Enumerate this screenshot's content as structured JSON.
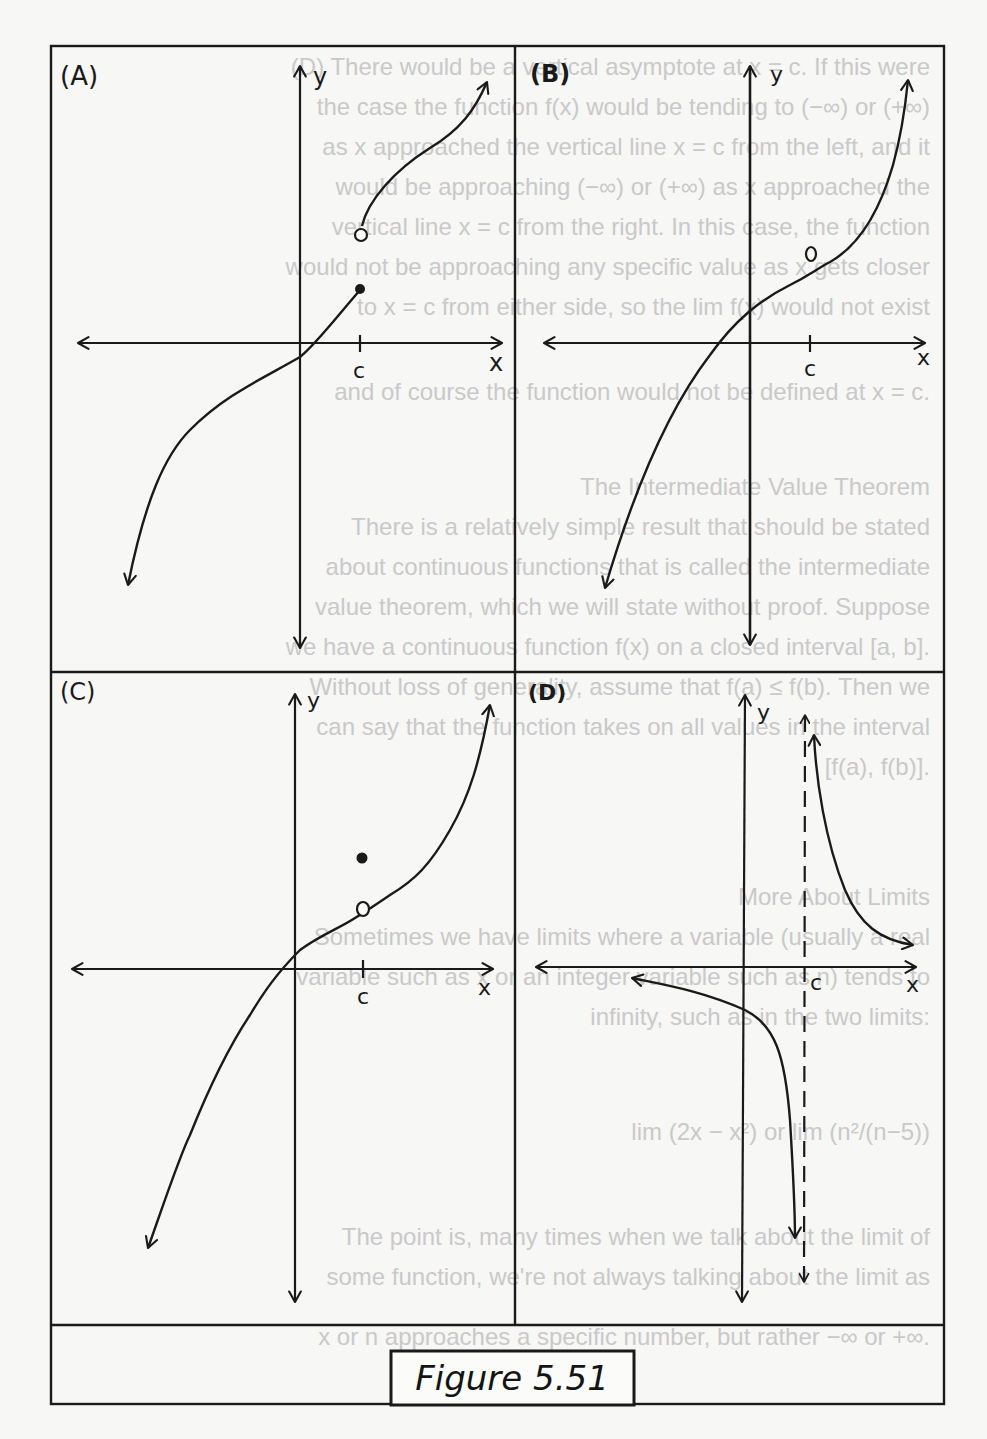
{
  "figure": {
    "caption": "Figure 5.51",
    "colors": {
      "ink": "#1a1a1a",
      "paper": "#f7f7f5",
      "bleed_through": "#c9c9c9"
    }
  },
  "panels": [
    {
      "label": "(A)",
      "x_axis_label": "x",
      "y_axis_label": "y",
      "tick_label": "c",
      "description": "Jump discontinuity at x = c: left branch ends at closed dot, right branch begins at open circle higher up."
    },
    {
      "label": "(B)",
      "x_axis_label": "x",
      "y_axis_label": "y",
      "tick_label": "c",
      "description": "Continuous increasing curve with an open circle (hole) at x = c."
    },
    {
      "label": "(C)",
      "x_axis_label": "x",
      "y_axis_label": "y",
      "tick_label": "c",
      "description": "Increasing curve with open circle at x = c and a separate filled dot above it (removable discontinuity)."
    },
    {
      "label": "(D)",
      "x_axis_label": "x",
      "y_axis_label": "y",
      "tick_label": "c",
      "description": "Vertical asymptote at x = c (dashed): left branch falls to -infinity, right branch descends from +infinity toward the x-axis."
    }
  ],
  "bleed_through_text": [
    "(D) There would be a vertical asymptote at x = c. If this were",
    "the case the function f(x) would be tending to (−∞) or (+∞)",
    "as x approached the vertical line x = c from the left, and it",
    "would be approaching (−∞) or (+∞) as x approached the",
    "vertical line x = c from the right. In this case, the function",
    "would not be approaching any specific value as x gets closer",
    "to x = c from either side, so the lim f(x) would not exist",
    "and of course the function would not be defined at x = c.",
    "The Intermediate Value Theorem",
    "There is a relatively simple result that should be stated",
    "about continuous functions that is called the intermediate",
    "value theorem, which we will state without proof. Suppose",
    "we have a continuous function f(x) on a closed interval [a, b].",
    "Without loss of generality, assume that f(a) ≤ f(b). Then we",
    "can say that the function takes on all values in the interval",
    "[f(a), f(b)].",
    "More About Limits",
    "Sometimes we have limits where a variable (usually a real",
    "variable such as x or an integer variable such as n) tends to",
    "infinity, such as in the two limits:",
    "lim (2x − x²)      or      lim (n²/(n−5))",
    "The point is, many times when we talk about the limit of",
    "some function, we're not always talking about the limit as",
    "x or n approaches a specific number, but rather −∞ or +∞."
  ]
}
